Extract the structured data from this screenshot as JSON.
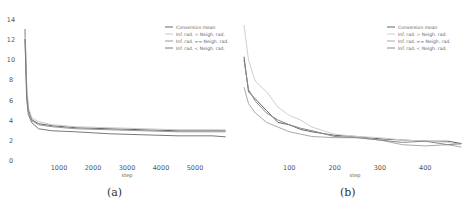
{
  "chart_data": [
    {
      "type": "line",
      "panel": "(a)",
      "xlabel": "step",
      "ylabel": "",
      "xlim": [
        0,
        6000
      ],
      "ylim": [
        0,
        14
      ],
      "xticks": [
        1000,
        2000,
        3000,
        4000,
        5000
      ],
      "yticks": [
        0,
        2,
        4,
        6,
        8,
        10,
        12,
        14
      ],
      "legend": [
        "Conversion mean",
        "Inf. rad. > Neigh. rad.",
        "Inf. rad. == Neigh. rad.",
        "Inf. rad. < Neigh. rad."
      ],
      "legend_position": "upper right",
      "grid": false,
      "series": [
        {
          "name": "Conversion mean",
          "color": "#666666",
          "x": [
            0,
            50,
            100,
            200,
            400,
            800,
            1500,
            2500,
            3500,
            4500,
            5500,
            5900
          ],
          "y": [
            13,
            7,
            5,
            4,
            3.6,
            3.4,
            3.2,
            3.1,
            3.0,
            2.9,
            2.9,
            2.9
          ]
        },
        {
          "name": "Inf. rad. > Neigh. rad.",
          "color": "#c8c8c8",
          "x": [
            0,
            50,
            100,
            200,
            400,
            800,
            1500,
            2500,
            3500,
            4500,
            5500,
            5900
          ],
          "y": [
            13,
            7.5,
            5.2,
            4.2,
            3.8,
            3.5,
            3.3,
            3.2,
            3.1,
            3.0,
            3.0,
            3.0
          ]
        },
        {
          "name": "Inf. rad. == Neigh. rad.",
          "color": "#999999",
          "x": [
            0,
            50,
            100,
            200,
            400,
            800,
            1500,
            2500,
            3500,
            4500,
            5500,
            5900
          ],
          "y": [
            12,
            6.5,
            4.8,
            3.9,
            3.5,
            3.3,
            3.1,
            3.0,
            2.9,
            2.8,
            2.8,
            2.8
          ]
        },
        {
          "name": "Inf. rad. < Neigh. rad.",
          "color": "#7a7a7a",
          "x": [
            0,
            50,
            100,
            200,
            400,
            800,
            1500,
            2500,
            3500,
            4500,
            5500,
            5900
          ],
          "y": [
            12,
            6,
            4.5,
            3.7,
            3.1,
            2.9,
            2.8,
            2.6,
            2.5,
            2.4,
            2.4,
            2.3
          ]
        }
      ]
    },
    {
      "type": "line",
      "panel": "(b)",
      "xlabel": "step",
      "ylabel": "",
      "xlim": [
        0,
        490
      ],
      "ylim": [
        2,
        14
      ],
      "xticks": [
        100,
        200,
        300,
        400
      ],
      "yticks": [
        2,
        4,
        6,
        8,
        10,
        12,
        14
      ],
      "legend": [
        "Conversion mean",
        "Inf. rad. > Neigh. rad.",
        "Inf. rad. == Neigh. rad.",
        "Inf. rad. < Neigh. rad."
      ],
      "legend_position": "upper right",
      "grid": false,
      "series": [
        {
          "name": "Conversion mean",
          "color": "#666666",
          "x": [
            0,
            10,
            25,
            50,
            75,
            100,
            125,
            150,
            200,
            250,
            300,
            350,
            400,
            450,
            480
          ],
          "y": [
            10.8,
            7.8,
            7.2,
            6.2,
            5.2,
            5.0,
            4.6,
            4.4,
            4.1,
            4.0,
            3.8,
            3.7,
            3.6,
            3.6,
            3.4
          ]
        },
        {
          "name": "Inf. rad. > Neigh. rad.",
          "color": "#d0d0d0",
          "x": [
            0,
            10,
            25,
            50,
            75,
            100,
            125,
            150,
            200,
            250,
            300,
            350,
            400,
            450,
            480
          ],
          "y": [
            13.5,
            10.5,
            8.7,
            7.8,
            6.5,
            5.8,
            5.4,
            4.8,
            4.2,
            4.0,
            3.9,
            3.7,
            3.6,
            3.5,
            3.3
          ]
        },
        {
          "name": "Inf. rad. == Neigh. rad.",
          "color": "#aaaaaa",
          "x": [
            0,
            10,
            25,
            50,
            75,
            100,
            125,
            150,
            200,
            250,
            300,
            350,
            400,
            450,
            480
          ],
          "y": [
            8.2,
            6.8,
            6.0,
            5.2,
            4.8,
            4.4,
            4.2,
            4.0,
            3.9,
            3.9,
            3.7,
            3.3,
            3.2,
            3.3,
            3.1
          ]
        },
        {
          "name": "Inf. rad. < Neigh. rad.",
          "color": "#8a8a8a",
          "x": [
            0,
            10,
            25,
            50,
            75,
            100,
            125,
            150,
            200,
            250,
            300,
            350,
            400,
            450,
            480
          ],
          "y": [
            10.5,
            8.0,
            7.0,
            6.0,
            5.4,
            5.0,
            4.7,
            4.5,
            4.0,
            3.9,
            3.7,
            3.5,
            3.6,
            3.3,
            3.4
          ]
        }
      ]
    }
  ],
  "captions": [
    "(a)",
    "(b)"
  ]
}
